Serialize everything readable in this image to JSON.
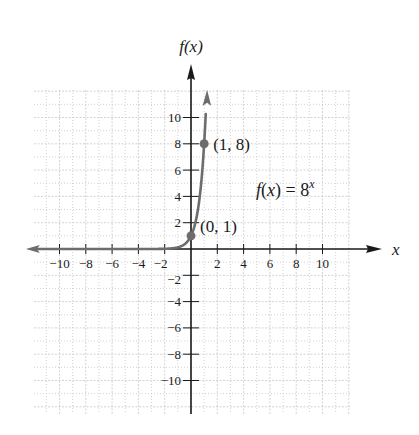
{
  "chart_data": {
    "type": "line",
    "title": "",
    "function_label": "f(x) = 8",
    "function_exponent": "x",
    "xlabel": "x",
    "ylabel": "f(x)",
    "xlim": [
      -12,
      12
    ],
    "ylim": [
      -12,
      12
    ],
    "x_ticks": [
      -10,
      -8,
      -6,
      -4,
      -2,
      2,
      4,
      6,
      8,
      10
    ],
    "y_ticks": [
      -10,
      -8,
      -6,
      -4,
      -2,
      2,
      4,
      6,
      8,
      10
    ],
    "x_tick_labels": [
      "−10",
      "−8",
      "−6",
      "−4",
      "−2",
      "2",
      "4",
      "6",
      "8",
      "10"
    ],
    "y_tick_labels": [
      "−10",
      "−8",
      "−6",
      "−4",
      "−2",
      "2",
      "4",
      "6",
      "8",
      "10"
    ],
    "grid": true,
    "series": [
      {
        "name": "f(x) = 8^x",
        "color": "#6d6d6d",
        "points": [
          [
            -12,
            0.0
          ],
          [
            -4,
            0.0002
          ],
          [
            -2,
            0.0156
          ],
          [
            -1,
            0.125
          ],
          [
            -0.5,
            0.354
          ],
          [
            0,
            1
          ],
          [
            0.5,
            2.83
          ],
          [
            1,
            8
          ],
          [
            1.15,
            10.9
          ]
        ]
      }
    ],
    "annotations": [
      {
        "point": [
          0,
          1
        ],
        "label": "(0, 1)"
      },
      {
        "point": [
          1,
          8
        ],
        "label": "(1, 8)"
      }
    ]
  },
  "colors": {
    "axis": "#1a1a1a",
    "curve": "#6d6d6d",
    "grid": "#c8c8c8",
    "text": "#1a1a1a"
  }
}
